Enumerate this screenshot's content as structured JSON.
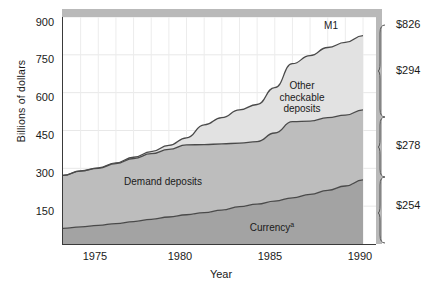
{
  "chart_data": {
    "type": "area",
    "title": "",
    "xlabel": "Year",
    "ylabel": "Billions of dollars",
    "xlim": [
      1973,
      1990
    ],
    "ylim": [
      0,
      900
    ],
    "yticks": [
      150,
      300,
      450,
      600,
      750,
      900
    ],
    "xticks": [
      1975,
      1980,
      1985,
      1990
    ],
    "grid": true,
    "stacked": true,
    "legend_position": "inside-plot",
    "x": [
      1973,
      1974,
      1975,
      1976,
      1977,
      1978,
      1979,
      1980,
      1981,
      1982,
      1983,
      1984,
      1985,
      1986,
      1987,
      1988,
      1989,
      1990
    ],
    "series": [
      {
        "name": "Currency",
        "label": "Currency",
        "label_superscript": "a",
        "color": "#a3a3a3",
        "values": [
          62,
          68,
          74,
          81,
          89,
          98,
          107,
          116,
          124,
          134,
          148,
          158,
          170,
          183,
          197,
          213,
          230,
          254
        ]
      },
      {
        "name": "Demand deposits",
        "label": "Demand deposits",
        "color": "#bdbdbd",
        "values": [
          210,
          221,
          226,
          238,
          250,
          260,
          268,
          277,
          270,
          263,
          252,
          248,
          270,
          302,
          290,
          288,
          281,
          278
        ]
      },
      {
        "name": "Other checkable deposits",
        "label": "Other checkable deposits",
        "color": "#e2e2e2",
        "values": [
          0,
          1,
          2,
          3,
          5,
          8,
          16,
          28,
          78,
          104,
          132,
          147,
          180,
          230,
          260,
          278,
          288,
          294
        ]
      }
    ],
    "total_line": {
      "name": "M1",
      "label": "M1",
      "values": [
        272,
        290,
        302,
        322,
        344,
        366,
        391,
        421,
        472,
        501,
        532,
        553,
        620,
        715,
        747,
        779,
        799,
        826
      ]
    },
    "brackets": [
      {
        "key": "total",
        "label": "$826",
        "series": "M1"
      },
      {
        "key": "other",
        "label": "$294",
        "series": "Other checkable deposits"
      },
      {
        "key": "demand",
        "label": "$278",
        "series": "Demand deposits"
      },
      {
        "key": "currency",
        "label": "$254",
        "series": "Currency"
      }
    ],
    "annotations": [
      {
        "name": "m1-label",
        "text": "M1"
      },
      {
        "name": "other-checkable-label",
        "text": "Other checkable deposits"
      },
      {
        "name": "demand-deposits-label",
        "text": "Demand deposits"
      },
      {
        "name": "currency-label",
        "text": "Currency"
      }
    ]
  },
  "axes": {
    "y_title": "Billions of dollars",
    "x_title": "Year",
    "y_tick_labels": [
      "900",
      "750",
      "600",
      "450",
      "300",
      "150"
    ],
    "x_tick_labels": [
      "1975",
      "1980",
      "1985",
      "1990"
    ]
  },
  "labels": {
    "m1": "M1",
    "other_l1": "Other",
    "other_l2": "checkable",
    "other_l3": "deposits",
    "demand": "Demand deposits",
    "currency": "Currency",
    "currency_sup": "a"
  },
  "brackets": {
    "total": "$826",
    "other": "$294",
    "demand": "$278",
    "currency": "$254"
  }
}
